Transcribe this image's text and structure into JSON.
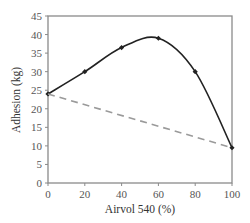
{
  "chart_data": {
    "type": "line",
    "title": "",
    "xlabel": "Airvol 540 (%)",
    "ylabel": "Adhesion (kg)",
    "xlim": [
      0,
      100
    ],
    "ylim": [
      0,
      45
    ],
    "xticks": [
      0,
      20,
      40,
      60,
      80,
      100
    ],
    "yticks": [
      0,
      5,
      10,
      15,
      20,
      25,
      30,
      35,
      40,
      45
    ],
    "grid": false,
    "legend": null,
    "series": [
      {
        "name": "Measured adhesion",
        "style": "solid-smooth",
        "markers": "diamond",
        "color": "#222222",
        "x": [
          0,
          20,
          40,
          60,
          80,
          100
        ],
        "y": [
          24,
          30,
          36.5,
          39,
          30,
          9.5
        ]
      },
      {
        "name": "Linear (additive) reference",
        "style": "dashed",
        "markers": "none",
        "color": "#999999",
        "x": [
          0,
          100
        ],
        "y": [
          24,
          9.5
        ]
      }
    ]
  },
  "colors": {
    "frame": "#8a8a8a",
    "main_line": "#222222",
    "dashed_line": "#9a9a9a"
  }
}
